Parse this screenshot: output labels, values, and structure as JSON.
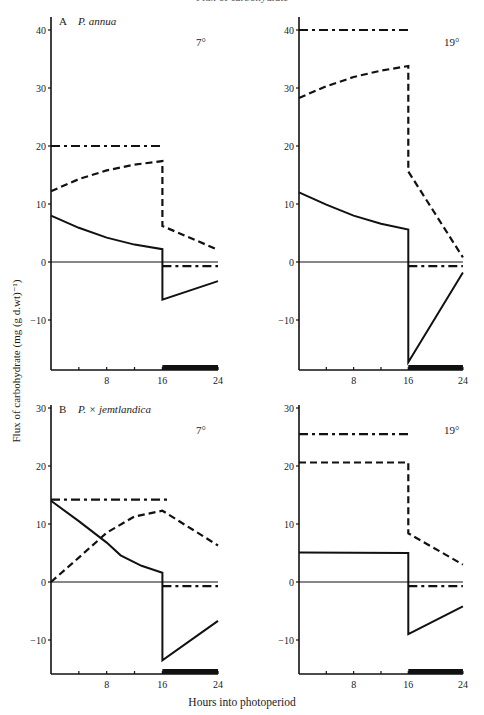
{
  "header_fragment": "Flux of carbohydrate",
  "axes": {
    "ylabel": "Flux of carbohydrate (mg (g d.wt)⁻¹)",
    "xlabel": "Hours into photoperiod",
    "xticks": [
      4,
      8,
      12,
      16,
      20,
      24
    ],
    "xtick_labels": [
      "8",
      "16",
      "24"
    ]
  },
  "rows": [
    {
      "id": "A",
      "letter": "A",
      "species": "P. annua",
      "ylim": [
        -18.6,
        42
      ],
      "yticks": [
        40,
        30,
        20,
        10,
        0,
        -10
      ]
    },
    {
      "id": "B",
      "letter": "B",
      "species": "P. × jemtlandica",
      "ylim": [
        -15.9,
        30.5
      ],
      "yticks": [
        30,
        20,
        10,
        0,
        -10
      ]
    }
  ],
  "chart_data": [
    {
      "type": "line",
      "panel": "A",
      "species": "P. annua",
      "temperature": "7°",
      "xlabel": "Hours into photoperiod",
      "ylabel": "Flux of carbohydrate (mg (g d.wt)⁻¹)",
      "xlim": [
        0,
        24
      ],
      "ylim": [
        -18.6,
        42
      ],
      "dark_period": [
        16,
        24
      ],
      "series": [
        {
          "name": "dash-dot",
          "style": "dashdot",
          "segments": [
            [
              [
                0,
                20
              ],
              [
                16,
                20
              ]
            ],
            [
              [
                16,
                -0.7
              ],
              [
                24,
                -0.7
              ]
            ]
          ]
        },
        {
          "name": "dashed",
          "style": "dashed",
          "segments": [
            [
              [
                0,
                12.2
              ],
              [
                4,
                14.3
              ],
              [
                8,
                15.8
              ],
              [
                12,
                16.8
              ],
              [
                16,
                17.4
              ],
              [
                16,
                6.2
              ],
              [
                24,
                2.1
              ]
            ]
          ]
        },
        {
          "name": "solid",
          "style": "solid",
          "segments": [
            [
              [
                0,
                8
              ],
              [
                4,
                5.9
              ],
              [
                8,
                4.2
              ],
              [
                12,
                3
              ],
              [
                16,
                2.2
              ],
              [
                16,
                -6.5
              ],
              [
                24,
                -3.3
              ]
            ]
          ]
        }
      ]
    },
    {
      "type": "line",
      "panel": "A",
      "species": "P. annua",
      "temperature": "19°",
      "xlabel": "Hours into photoperiod",
      "ylabel": "Flux of carbohydrate (mg (g d.wt)⁻¹)",
      "xlim": [
        0,
        24
      ],
      "ylim": [
        -18.6,
        42
      ],
      "dark_period": [
        16,
        24
      ],
      "series": [
        {
          "name": "dash-dot",
          "style": "dashdot",
          "segments": [
            [
              [
                0,
                40
              ],
              [
                16,
                40
              ]
            ],
            [
              [
                16,
                -0.7
              ],
              [
                24,
                -0.7
              ]
            ]
          ]
        },
        {
          "name": "dashed",
          "style": "dashed",
          "segments": [
            [
              [
                0,
                28.3
              ],
              [
                4,
                30.3
              ],
              [
                8,
                31.9
              ],
              [
                12,
                33
              ],
              [
                16,
                33.8
              ],
              [
                16,
                15.6
              ],
              [
                24,
                0.8
              ]
            ]
          ]
        },
        {
          "name": "solid",
          "style": "solid",
          "segments": [
            [
              [
                0,
                12
              ],
              [
                4,
                9.9
              ],
              [
                8,
                8
              ],
              [
                12,
                6.6
              ],
              [
                16,
                5.6
              ],
              [
                16,
                -17.3
              ],
              [
                24,
                -1.8
              ]
            ]
          ]
        }
      ]
    },
    {
      "type": "line",
      "panel": "B",
      "species": "P. × jemtlandica",
      "temperature": "7°",
      "xlabel": "Hours into photoperiod",
      "ylabel": "Flux of carbohydrate (mg (g d.wt)⁻¹)",
      "xlim": [
        0,
        24
      ],
      "ylim": [
        -15.9,
        30.5
      ],
      "dark_period": [
        16,
        24
      ],
      "series": [
        {
          "name": "dash-dot",
          "style": "dashdot",
          "segments": [
            [
              [
                0,
                14.2
              ],
              [
                16.8,
                14.2
              ]
            ],
            [
              [
                16,
                -0.7
              ],
              [
                24,
                -0.7
              ]
            ]
          ]
        },
        {
          "name": "dashed",
          "style": "dashed",
          "segments": [
            [
              [
                0,
                0
              ],
              [
                4,
                4.2
              ],
              [
                8,
                8.5
              ],
              [
                12,
                11.3
              ],
              [
                16,
                12.3
              ],
              [
                24,
                6.3
              ]
            ]
          ]
        },
        {
          "name": "solid",
          "style": "solid",
          "segments": [
            [
              [
                0,
                14
              ],
              [
                4,
                10.5
              ],
              [
                8,
                6.8
              ],
              [
                10,
                4.6
              ],
              [
                13,
                2.8
              ],
              [
                16,
                1.6
              ],
              [
                16,
                -13.5
              ],
              [
                24,
                -6.7
              ]
            ]
          ]
        }
      ]
    },
    {
      "type": "line",
      "panel": "B",
      "species": "P. × jemtlandica",
      "temperature": "19°",
      "xlabel": "Hours into photoperiod",
      "ylabel": "Flux of carbohydrate (mg (g d.wt)⁻¹)",
      "xlim": [
        0,
        24
      ],
      "ylim": [
        -15.9,
        30.5
      ],
      "dark_period": [
        16,
        24
      ],
      "series": [
        {
          "name": "dash-dot",
          "style": "dashdot",
          "segments": [
            [
              [
                0,
                25.5
              ],
              [
                16,
                25.5
              ]
            ],
            [
              [
                16,
                -0.7
              ],
              [
                24,
                -0.7
              ]
            ]
          ]
        },
        {
          "name": "dashed",
          "style": "dashed",
          "segments": [
            [
              [
                0,
                20.6
              ],
              [
                16,
                20.6
              ],
              [
                16,
                8.4
              ],
              [
                24,
                3
              ]
            ]
          ]
        },
        {
          "name": "solid",
          "style": "solid",
          "segments": [
            [
              [
                0,
                5.1
              ],
              [
                16,
                5
              ],
              [
                16,
                -9
              ],
              [
                24,
                -4.2
              ]
            ]
          ]
        }
      ]
    }
  ]
}
